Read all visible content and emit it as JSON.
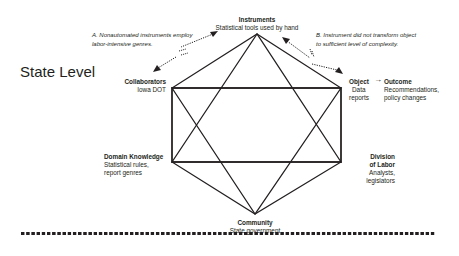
{
  "level_title": "State Level",
  "nodes": {
    "instruments": {
      "title": "Instruments",
      "sub": "Statistical tools used by hand"
    },
    "collaborators": {
      "title": "Collaborators",
      "sub": "Iowa DOT"
    },
    "object": {
      "title": "Object",
      "sub1": "Data",
      "sub2": "reports"
    },
    "outcome": {
      "title": "Outcome",
      "sub1": "Recommendations,",
      "sub2": "policy changes"
    },
    "domain_knowledge": {
      "title": "Domain Knowledge",
      "sub1": "Statistical rules,",
      "sub2": "report genres"
    },
    "division_of_labor": {
      "title1": "Division",
      "title2": "of Labor",
      "sub1": "Analysts,",
      "sub2": "legislators"
    },
    "community": {
      "title": "Community",
      "sub": "State government"
    }
  },
  "notes": {
    "a": {
      "line1": "A. Nonautomated instruments employ",
      "line2": "labor-intensive genres."
    },
    "b": {
      "line1": "B. Instrument did not transform object",
      "line2": "to sufficient level of complexity."
    }
  },
  "arrow_glyph": "→",
  "colors": {
    "ink": "#231f20",
    "background": "#ffffff"
  }
}
